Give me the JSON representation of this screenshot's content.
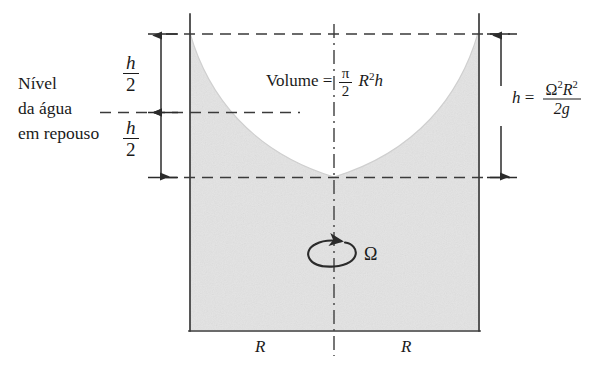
{
  "figure": {
    "caption_lines": [
      "Nível",
      "da água",
      "em repouso"
    ],
    "labels": {
      "h_half_top": "h/2",
      "h_half_bottom": "h/2",
      "omega": "Ω",
      "radius_left": "R",
      "radius_right": "R"
    },
    "formulas": {
      "volume": {
        "lhs": "Volume",
        "equals": "=",
        "numerator": "π",
        "denominator": "2",
        "tail_base": "R",
        "tail_exp": "2",
        "tail_var": "h",
        "plain": "Volume = (π/2) R²h"
      },
      "height": {
        "lhs": "h",
        "equals": "=",
        "num_a": "Ω",
        "num_a_exp": "2",
        "num_b": "R",
        "num_b_exp": "2",
        "denominator": "2g",
        "plain": "h = Ω²R² / 2g"
      }
    },
    "math_symbols": {
      "h": "h",
      "two": "2",
      "omega": "Ω",
      "R": "R",
      "g": "g",
      "pi": "π",
      "equals": "="
    },
    "colors": {
      "fluid_fill": "#e3e3e3",
      "stroke": "#3a3a3a",
      "text": "#1a1a1a",
      "background": "#ffffff"
    }
  }
}
